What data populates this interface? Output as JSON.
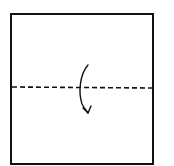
{
  "diagram": {
    "type": "origami-fold-step",
    "paper": {
      "shape": "square",
      "x": 11,
      "y": 14,
      "width": 142,
      "height": 150,
      "fill": "#ffffff",
      "stroke": "#111111"
    },
    "fold_line": {
      "style": "dashed",
      "kind": "valley-fold",
      "y": 87,
      "x1": 12,
      "x2": 152,
      "stroke": "#111111"
    },
    "arrow": {
      "direction": "top-to-bottom",
      "description": "fold top half down toward bottom",
      "stroke": "#111111"
    }
  }
}
